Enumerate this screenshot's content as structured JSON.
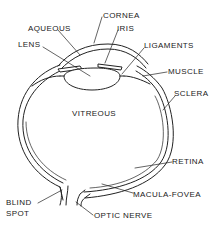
{
  "diagram": {
    "labels": {
      "cornea": "CORNEA",
      "aqueous": "AQUEOUS",
      "iris": "IRIS",
      "lens": "LENS",
      "ligaments": "LIGAMENTS",
      "muscle": "MUSCLE",
      "sclera": "SCLERA",
      "vitreous": "VITREOUS",
      "retina": "RETINA",
      "macula_fovea": "MACULA-FOVEA",
      "blind_spot_line1": "BLIND",
      "blind_spot_line2": "SPOT",
      "optic_nerve": "OPTIC NERVE"
    },
    "colors": {
      "line": "#222222",
      "background": "#ffffff"
    }
  }
}
